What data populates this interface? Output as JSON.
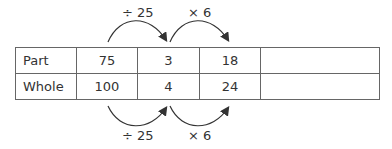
{
  "diagram": {
    "top_operations": [
      {
        "label": "÷ 25",
        "from_col": 1,
        "to_col": 2
      },
      {
        "label": "× 6",
        "from_col": 2,
        "to_col": 3
      }
    ],
    "bottom_operations": [
      {
        "label": "÷ 25",
        "from_col": 1,
        "to_col": 2
      },
      {
        "label": "× 6",
        "from_col": 2,
        "to_col": 3
      }
    ],
    "table": {
      "rows": [
        {
          "header": "Part",
          "values": [
            "75",
            "3",
            "18",
            ""
          ]
        },
        {
          "header": "Whole",
          "values": [
            "100",
            "4",
            "24",
            ""
          ]
        }
      ]
    }
  }
}
